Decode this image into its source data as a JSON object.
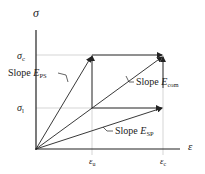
{
  "diagram": {
    "axes": {
      "y_label": "σ",
      "x_label": "ε"
    },
    "y_ticks": [
      {
        "symbol": "σ",
        "sub": "c",
        "id": "sigma-c"
      },
      {
        "symbol": "σ",
        "sub": "l",
        "id": "sigma-l"
      }
    ],
    "x_ticks": [
      {
        "symbol": "ε",
        "sub": "u",
        "id": "epsilon-u"
      },
      {
        "symbol": "ε",
        "sub": "c",
        "id": "epsilon-c"
      }
    ],
    "slopes": [
      {
        "prefix": "Slope ",
        "symbol": "E",
        "sub": "PS",
        "id": "slope-ps"
      },
      {
        "prefix": "Slope ",
        "symbol": "E",
        "sub": "com",
        "id": "slope-com"
      },
      {
        "prefix": "Slope ",
        "symbol": "E",
        "sub": "SP",
        "id": "slope-sp"
      }
    ],
    "colors": {
      "line": "#222222",
      "grid": "#bbbbbb"
    }
  }
}
